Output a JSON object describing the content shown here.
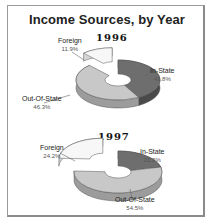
{
  "title": "Income Sources, by Year",
  "colors": {
    "in_state": "#6e6e6e",
    "in_state_side": "#4a4a4a",
    "out_of_state": "#c8c8c8",
    "out_of_state_side": "#9c9c9c",
    "foreign": "#f7f7f7",
    "foreign_side": "#d6d6d6",
    "outline": "#555555"
  },
  "charts": [
    {
      "year": "1996",
      "slices": [
        {
          "label": "Foreign",
          "pct": "11.9%"
        },
        {
          "label": "In-State",
          "pct": "41.8%"
        },
        {
          "label": "Out-Of-State",
          "pct": "46.3%"
        }
      ]
    },
    {
      "year": "1997",
      "slices": [
        {
          "label": "Foreign",
          "pct": "24.2%"
        },
        {
          "label": "In-State",
          "pct": "21.2%"
        },
        {
          "label": "Out-Of-State",
          "pct": "54.5%"
        }
      ]
    }
  ],
  "chart_data": [
    {
      "type": "pie",
      "title": "Income Sources, by Year — 1996",
      "categories": [
        "Foreign",
        "In-State",
        "Out-Of-State"
      ],
      "values": [
        11.9,
        41.8,
        46.3
      ],
      "units": "%",
      "style": "3D exploded doughnut",
      "legend": "data labels"
    },
    {
      "type": "pie",
      "title": "Income Sources, by Year — 1997",
      "categories": [
        "Foreign",
        "In-State",
        "Out-Of-State"
      ],
      "values": [
        24.2,
        21.2,
        54.5
      ],
      "units": "%",
      "style": "3D exploded doughnut",
      "legend": "data labels"
    }
  ]
}
